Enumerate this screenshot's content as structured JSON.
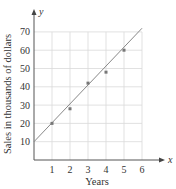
{
  "chart_data": {
    "type": "scatter",
    "title": "",
    "xlabel": "Years",
    "ylabel": "Sales in thousands of dollars",
    "x_axis_var": "x",
    "y_axis_var": "y",
    "xlim": [
      0,
      6
    ],
    "ylim": [
      0,
      70
    ],
    "x_ticks": [
      1,
      2,
      3,
      4,
      5,
      6
    ],
    "y_ticks": [
      10,
      20,
      30,
      40,
      50,
      60,
      70
    ],
    "grid": true,
    "legend": null,
    "series": [
      {
        "name": "data points",
        "type": "scatter",
        "x": [
          1,
          2,
          3,
          4,
          5
        ],
        "y": [
          20,
          28,
          42,
          48,
          60
        ]
      },
      {
        "name": "fitted line",
        "type": "line",
        "x": [
          0,
          6
        ],
        "y": [
          10,
          72
        ]
      }
    ],
    "colors": {
      "grid": "#d9d9d9",
      "axis": "#555555",
      "line": "#888888",
      "points": "#777777"
    }
  }
}
